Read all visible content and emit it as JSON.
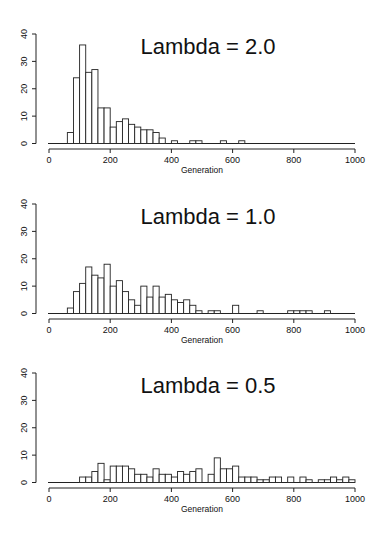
{
  "chart_data": [
    {
      "type": "bar",
      "subtype": "histogram",
      "title": "Lambda = 2.0",
      "xlabel": "Generation",
      "ylabel": "",
      "xlim": [
        0,
        1000
      ],
      "ylim": [
        0,
        40
      ],
      "x_ticks": [
        0,
        200,
        400,
        600,
        800,
        1000
      ],
      "y_ticks": [
        0,
        10,
        20,
        30,
        40
      ],
      "bin_width": 20,
      "bins": [
        {
          "start": 60,
          "count": 4
        },
        {
          "start": 80,
          "count": 24
        },
        {
          "start": 100,
          "count": 36
        },
        {
          "start": 120,
          "count": 26
        },
        {
          "start": 140,
          "count": 27
        },
        {
          "start": 160,
          "count": 13
        },
        {
          "start": 180,
          "count": 13
        },
        {
          "start": 200,
          "count": 6
        },
        {
          "start": 220,
          "count": 8
        },
        {
          "start": 240,
          "count": 9
        },
        {
          "start": 260,
          "count": 7
        },
        {
          "start": 280,
          "count": 6
        },
        {
          "start": 300,
          "count": 5
        },
        {
          "start": 320,
          "count": 5
        },
        {
          "start": 340,
          "count": 4
        },
        {
          "start": 360,
          "count": 2
        },
        {
          "start": 400,
          "count": 1
        },
        {
          "start": 460,
          "count": 1
        },
        {
          "start": 480,
          "count": 1
        },
        {
          "start": 560,
          "count": 1
        },
        {
          "start": 620,
          "count": 1
        }
      ]
    },
    {
      "type": "bar",
      "subtype": "histogram",
      "title": "Lambda = 1.0",
      "xlabel": "Generation",
      "ylabel": "",
      "xlim": [
        0,
        1000
      ],
      "ylim": [
        0,
        40
      ],
      "x_ticks": [
        0,
        200,
        400,
        600,
        800,
        1000
      ],
      "y_ticks": [
        0,
        10,
        20,
        30,
        40
      ],
      "bin_width": 20,
      "bins": [
        {
          "start": 60,
          "count": 2
        },
        {
          "start": 80,
          "count": 8
        },
        {
          "start": 100,
          "count": 11
        },
        {
          "start": 120,
          "count": 17
        },
        {
          "start": 140,
          "count": 14
        },
        {
          "start": 160,
          "count": 13
        },
        {
          "start": 180,
          "count": 18
        },
        {
          "start": 200,
          "count": 10
        },
        {
          "start": 220,
          "count": 12
        },
        {
          "start": 240,
          "count": 8
        },
        {
          "start": 260,
          "count": 5
        },
        {
          "start": 280,
          "count": 3
        },
        {
          "start": 300,
          "count": 10
        },
        {
          "start": 320,
          "count": 6
        },
        {
          "start": 340,
          "count": 10
        },
        {
          "start": 360,
          "count": 6
        },
        {
          "start": 380,
          "count": 7
        },
        {
          "start": 400,
          "count": 5
        },
        {
          "start": 420,
          "count": 4
        },
        {
          "start": 440,
          "count": 5
        },
        {
          "start": 460,
          "count": 3
        },
        {
          "start": 480,
          "count": 1
        },
        {
          "start": 520,
          "count": 1
        },
        {
          "start": 540,
          "count": 1
        },
        {
          "start": 600,
          "count": 3
        },
        {
          "start": 680,
          "count": 1
        },
        {
          "start": 780,
          "count": 1
        },
        {
          "start": 800,
          "count": 1
        },
        {
          "start": 820,
          "count": 1
        },
        {
          "start": 840,
          "count": 1
        },
        {
          "start": 900,
          "count": 1
        }
      ]
    },
    {
      "type": "bar",
      "subtype": "histogram",
      "title": "Lambda = 0.5",
      "xlabel": "Generation",
      "ylabel": "",
      "xlim": [
        0,
        1000
      ],
      "ylim": [
        0,
        40
      ],
      "x_ticks": [
        0,
        200,
        400,
        600,
        800,
        1000
      ],
      "y_ticks": [
        0,
        10,
        20,
        30,
        40
      ],
      "bin_width": 20,
      "bins": [
        {
          "start": 100,
          "count": 2
        },
        {
          "start": 120,
          "count": 2
        },
        {
          "start": 140,
          "count": 4
        },
        {
          "start": 160,
          "count": 7
        },
        {
          "start": 180,
          "count": 1
        },
        {
          "start": 200,
          "count": 6
        },
        {
          "start": 220,
          "count": 6
        },
        {
          "start": 240,
          "count": 6
        },
        {
          "start": 260,
          "count": 5
        },
        {
          "start": 280,
          "count": 3
        },
        {
          "start": 300,
          "count": 3
        },
        {
          "start": 320,
          "count": 2
        },
        {
          "start": 340,
          "count": 5
        },
        {
          "start": 360,
          "count": 3
        },
        {
          "start": 380,
          "count": 3
        },
        {
          "start": 400,
          "count": 2
        },
        {
          "start": 420,
          "count": 4
        },
        {
          "start": 440,
          "count": 3
        },
        {
          "start": 460,
          "count": 4
        },
        {
          "start": 480,
          "count": 5
        },
        {
          "start": 520,
          "count": 3
        },
        {
          "start": 540,
          "count": 9
        },
        {
          "start": 560,
          "count": 5
        },
        {
          "start": 580,
          "count": 5
        },
        {
          "start": 600,
          "count": 6
        },
        {
          "start": 620,
          "count": 2
        },
        {
          "start": 640,
          "count": 2
        },
        {
          "start": 660,
          "count": 2
        },
        {
          "start": 680,
          "count": 1
        },
        {
          "start": 700,
          "count": 1
        },
        {
          "start": 720,
          "count": 2
        },
        {
          "start": 740,
          "count": 2
        },
        {
          "start": 780,
          "count": 2
        },
        {
          "start": 820,
          "count": 2
        },
        {
          "start": 840,
          "count": 1
        },
        {
          "start": 880,
          "count": 1
        },
        {
          "start": 900,
          "count": 1
        },
        {
          "start": 920,
          "count": 2
        },
        {
          "start": 940,
          "count": 1
        },
        {
          "start": 960,
          "count": 2
        },
        {
          "start": 980,
          "count": 1
        }
      ]
    }
  ],
  "style": {
    "bar_fill": "#ffffff",
    "bar_stroke": "#222222",
    "axis_color": "#222222",
    "text_color": "#111111"
  }
}
